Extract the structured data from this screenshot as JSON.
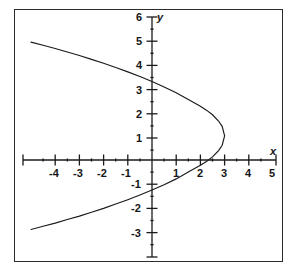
{
  "chart_data": {
    "type": "line",
    "title": "",
    "xlabel": "x",
    "ylabel": "y",
    "xlim": [
      -5,
      5
    ],
    "ylim": [
      -4,
      6
    ],
    "grid": false,
    "legend": "none",
    "equation_note": "(y - 1)^2 = 1.5(3 - x)",
    "vertex": [
      3,
      1
    ],
    "y_intercepts": [
      3.5,
      -1.5
    ],
    "x_ticks": [
      -4,
      -3,
      -2,
      -1,
      1,
      2,
      3,
      4,
      5
    ],
    "x_tick_labels": [
      "-4",
      "-3",
      "-2",
      "-1",
      "1",
      "2",
      "3",
      "4",
      "5"
    ],
    "y_ticks": [
      -3,
      -2,
      -1,
      1,
      2,
      3,
      4,
      5,
      6
    ],
    "y_tick_labels": [
      "-3",
      "-2",
      "-1",
      "1",
      "2",
      "3",
      "4",
      "5",
      "6"
    ],
    "minor_ticks": true,
    "curve_color": "#1a1a1a",
    "axis_color": "#1a1a1a",
    "frame_color": "#2b2b2b",
    "series": [
      {
        "name": "upper-branch",
        "points": [
          [
            -5.0,
            4.87
          ],
          [
            -4.5,
            4.74
          ],
          [
            -4.0,
            4.61
          ],
          [
            -3.5,
            4.46
          ],
          [
            -3.0,
            4.32
          ],
          [
            -2.5,
            4.16
          ],
          [
            -2.0,
            4.0
          ],
          [
            -1.5,
            3.82
          ],
          [
            -1.0,
            3.64
          ],
          [
            -0.5,
            3.45
          ],
          [
            0.0,
            3.24
          ],
          [
            0.5,
            3.02
          ],
          [
            1.0,
            2.78
          ],
          [
            1.5,
            2.5
          ],
          [
            2.0,
            2.22
          ],
          [
            2.25,
            2.06
          ],
          [
            2.5,
            1.87
          ],
          [
            2.75,
            1.61
          ],
          [
            2.9,
            1.39
          ],
          [
            3.0,
            1.0
          ]
        ]
      },
      {
        "name": "lower-branch",
        "points": [
          [
            -5.0,
            -2.87
          ],
          [
            -4.5,
            -2.74
          ],
          [
            -4.0,
            -2.61
          ],
          [
            -3.5,
            -2.46
          ],
          [
            -3.0,
            -2.32
          ],
          [
            -2.5,
            -2.16
          ],
          [
            -2.0,
            -2.0
          ],
          [
            -1.5,
            -1.82
          ],
          [
            -1.0,
            -1.64
          ],
          [
            -0.5,
            -1.45
          ],
          [
            0.0,
            -1.24
          ],
          [
            0.5,
            -1.02
          ],
          [
            1.0,
            -0.78
          ],
          [
            1.5,
            -0.5
          ],
          [
            2.0,
            -0.22
          ],
          [
            2.25,
            -0.06
          ],
          [
            2.5,
            0.13
          ],
          [
            2.75,
            0.39
          ],
          [
            2.9,
            0.61
          ],
          [
            3.0,
            1.0
          ]
        ]
      }
    ]
  },
  "axes": {
    "x_axis_name": "x",
    "y_axis_name": "y"
  },
  "labels": {
    "x": {
      "m4": "-4",
      "m3": "-3",
      "m2": "-2",
      "m1": "-1",
      "p1": "1",
      "p2": "2",
      "p3": "3",
      "p4": "4",
      "p5": "5"
    },
    "y": {
      "m3": "-3",
      "m2": "-2",
      "m1": "-1",
      "p1": "1",
      "p2": "2",
      "p3": "3",
      "p4": "4",
      "p5": "5",
      "p6": "6"
    }
  }
}
